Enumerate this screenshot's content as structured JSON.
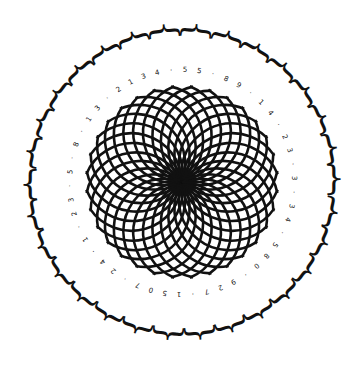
{
  "figure": {
    "center": [
      182,
      182
    ],
    "colors": {
      "ink": "#111111",
      "background": "#ffffff"
    },
    "rosette": {
      "radius": 96,
      "arc_count": 32,
      "stroke_width": 2.6
    },
    "digit_ring": {
      "radius": 112,
      "digits": [
        "3",
        "4",
        "·",
        "5",
        "5",
        "·",
        "8",
        "9",
        "·",
        "1",
        "4",
        "·",
        "2",
        "3",
        "·",
        "3",
        "·",
        "3",
        "4",
        "·",
        "5",
        "8",
        "0",
        "·",
        "9",
        "2",
        "7",
        "·",
        "1",
        "5",
        "0",
        "7",
        "·",
        "2",
        "4",
        "·",
        "1",
        "·",
        "2",
        "3",
        "·",
        "5",
        "·",
        "8",
        "·",
        "1",
        "3",
        "·",
        "2",
        "1"
      ]
    },
    "brace_ring": {
      "radius": 152,
      "count": 30,
      "glyph": "{"
    }
  }
}
